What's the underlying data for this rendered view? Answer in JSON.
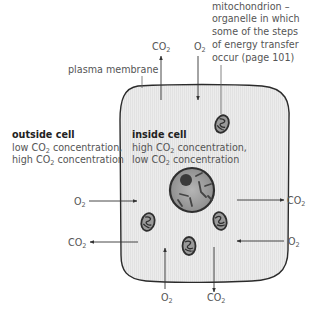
{
  "diagram": {
    "colors": {
      "cell_fill": "#ebebeb",
      "cell_outline": "#2b2b2b",
      "text": "#555555",
      "heading": "#222222",
      "arrow": "#333333",
      "organelle_dark": "#3a3a3a",
      "organelle_light": "#9a9a9a"
    },
    "labels": {
      "plasma_membrane": "plasma membrane",
      "mitochondrion": [
        "mitochondrion –",
        "organelle in which",
        "some of the steps",
        "of energy transfer",
        "occur (page 101)"
      ],
      "outside_cell": {
        "heading": "outside cell",
        "line1_pre": "low CO",
        "line1_sub": "2",
        "line1_post": " concentration,",
        "line2_pre": "high CO",
        "line2_sub": "2",
        "line2_post": " concentration"
      },
      "inside_cell": {
        "heading": "inside cell",
        "line1_pre": "high CO",
        "line1_sub": "2",
        "line1_post": " concentration,",
        "line2_pre": "low CO",
        "line2_sub": "2",
        "line2_post": " concentration"
      }
    },
    "gas_arrows": [
      {
        "id": "top-co2",
        "gas": "CO",
        "sub": "2",
        "direction": "out",
        "side": "top"
      },
      {
        "id": "top-o2",
        "gas": "O",
        "sub": "2",
        "direction": "in",
        "side": "top"
      },
      {
        "id": "left-o2",
        "gas": "O",
        "sub": "2",
        "direction": "in",
        "side": "left"
      },
      {
        "id": "left-co2",
        "gas": "CO",
        "sub": "2",
        "direction": "out",
        "side": "left"
      },
      {
        "id": "right-co2",
        "gas": "CO",
        "sub": "2",
        "direction": "out",
        "side": "right"
      },
      {
        "id": "right-o2",
        "gas": "O",
        "sub": "2",
        "direction": "in",
        "side": "right"
      },
      {
        "id": "bottom-o2",
        "gas": "O",
        "sub": "2",
        "direction": "in",
        "side": "bottom"
      },
      {
        "id": "bottom-co2",
        "gas": "CO",
        "sub": "2",
        "direction": "out",
        "side": "bottom"
      }
    ],
    "organelles": {
      "nucleus_count": 1,
      "mitochondria_count": 4
    }
  }
}
